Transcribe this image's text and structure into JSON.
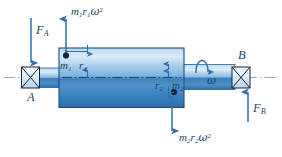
{
  "figure": {
    "name": "rotating-shaft-dynamic-balance-free-body-diagram",
    "type": "mechanical-engineering-free-body-diagram",
    "colors": {
      "body_light": "#cfe3f3",
      "body_mid": "#5d9dd0",
      "body_dark": "#2a6fae",
      "outline": "#1d4f80",
      "arrow": "#2f6fae",
      "label": "#1c3f66",
      "centerline": "#8fa9bd",
      "background": "#ffffff"
    },
    "labels": {
      "force_a": {
        "symbol": "F",
        "sub": "A",
        "text": "F_A"
      },
      "force_b": {
        "symbol": "F",
        "sub": "B",
        "text": "F_B"
      },
      "bearing_a": {
        "text": "A"
      },
      "bearing_b": {
        "text": "B"
      },
      "mass_1": {
        "symbol": "m",
        "sub": "1",
        "text": "m_1"
      },
      "mass_2": {
        "symbol": "m",
        "sub": "2",
        "text": "m_2"
      },
      "radius_1": {
        "symbol": "r",
        "sub": "1",
        "text": "r_1"
      },
      "radius_2": {
        "symbol": "r",
        "sub": "2",
        "text": "r_2"
      },
      "angular_velocity": {
        "symbol": "ω",
        "text": "omega"
      },
      "centrifugal_force_1": {
        "m": "m",
        "m_sub": "1",
        "r": "r",
        "r_sub": "1",
        "w": "ω",
        "exp": "2",
        "text": "m_1 r_1 omega^2"
      },
      "centrifugal_force_2": {
        "m": "m",
        "m_sub": "2",
        "r": "r",
        "r_sub": "2",
        "w": "ω",
        "exp": "2",
        "text": "m_2 r_2 omega^2"
      }
    },
    "elements": [
      {
        "name": "bearing-a",
        "kind": "pillow-block-bearing",
        "position": "left-end"
      },
      {
        "name": "bearing-b",
        "kind": "pillow-block-bearing",
        "position": "right-end"
      },
      {
        "name": "rotor-body",
        "kind": "cylinder",
        "position": "center"
      },
      {
        "name": "left-shaft",
        "kind": "shaft-stub",
        "position": "left"
      },
      {
        "name": "right-shaft",
        "kind": "shaft-stub",
        "position": "right"
      },
      {
        "name": "axis-centerline",
        "kind": "dash-dot-line"
      }
    ],
    "arrows": {
      "force_a_direction": "down",
      "force_b_direction": "up",
      "centrifugal_1_direction": "up",
      "centrifugal_2_direction": "down",
      "omega_direction": "curved-clockwise-about-axis"
    }
  }
}
